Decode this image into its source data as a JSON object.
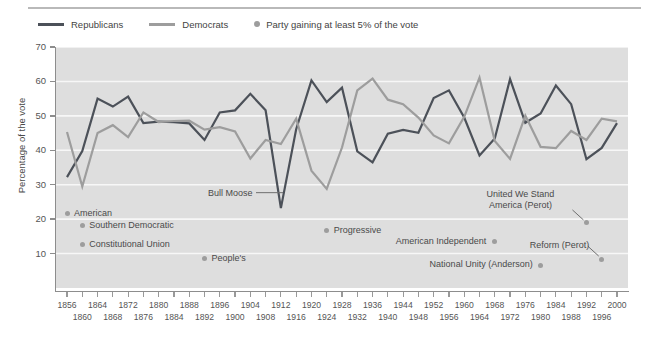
{
  "legend": {
    "items": [
      {
        "label": "Republicans",
        "kind": "line",
        "color": "#4c5159",
        "icon": "line-swatch-icon"
      },
      {
        "label": "Democrats",
        "kind": "line",
        "color": "#9d9d9d",
        "icon": "line-swatch-icon"
      },
      {
        "label": "Party gaining at least 5% of the vote",
        "kind": "dot",
        "color": "#9d9d9d",
        "icon": "dot-swatch-icon"
      }
    ]
  },
  "chart_data": {
    "type": "line",
    "title": "",
    "xlabel": "",
    "ylabel": "Percentage of the vote",
    "ylim": [
      0,
      70
    ],
    "yticks": [
      10,
      20,
      30,
      40,
      50,
      60,
      70
    ],
    "grid": true,
    "legend_position": "top-left",
    "plot_background": "#dedede",
    "x": [
      1856,
      1860,
      1864,
      1868,
      1872,
      1876,
      1880,
      1884,
      1888,
      1892,
      1896,
      1900,
      1904,
      1908,
      1912,
      1916,
      1920,
      1924,
      1928,
      1932,
      1936,
      1940,
      1944,
      1948,
      1952,
      1956,
      1960,
      1964,
      1968,
      1972,
      1976,
      1980,
      1984,
      1988,
      1992,
      1996,
      2000
    ],
    "series": [
      {
        "name": "Republicans",
        "color": "#4c5159",
        "values": [
          32.2,
          39.8,
          55.0,
          52.7,
          55.6,
          47.9,
          48.3,
          48.2,
          47.8,
          43.0,
          51.0,
          51.6,
          56.4,
          51.6,
          23.2,
          46.1,
          60.3,
          54.0,
          58.2,
          39.7,
          36.5,
          44.8,
          45.9,
          45.1,
          55.2,
          57.4,
          49.5,
          38.5,
          43.4,
          60.7,
          48.0,
          50.7,
          58.8,
          53.4,
          37.4,
          40.7,
          47.9
        ]
      },
      {
        "name": "Democrats",
        "color": "#9d9d9d",
        "values": [
          45.3,
          29.5,
          45.0,
          47.3,
          43.8,
          51.0,
          48.2,
          48.5,
          48.6,
          46.0,
          46.7,
          45.5,
          37.6,
          43.0,
          41.8,
          49.2,
          34.1,
          28.8,
          40.8,
          57.4,
          60.8,
          54.7,
          53.4,
          49.5,
          44.3,
          42.0,
          49.7,
          61.1,
          42.7,
          37.5,
          50.1,
          41.0,
          40.6,
          45.6,
          43.0,
          49.2,
          48.4
        ]
      }
    ],
    "third_party_points": [
      {
        "label": "American",
        "year": 1856,
        "value": 21.5,
        "label_position": "right",
        "leader": false
      },
      {
        "label": "Southern Democratic",
        "year": 1860,
        "value": 18.1,
        "label_position": "right",
        "leader": false
      },
      {
        "label": "Constitutional Union",
        "year": 1860,
        "value": 12.6,
        "label_position": "right",
        "leader": false
      },
      {
        "label": "People's",
        "year": 1892,
        "value": 8.5,
        "label_position": "right",
        "leader": false
      },
      {
        "label": "Bull Moose",
        "year": 1912,
        "value": 27.4,
        "label_position": "left",
        "leader": true
      },
      {
        "label": "Progressive",
        "year": 1924,
        "value": 16.6,
        "label_position": "right",
        "leader": false
      },
      {
        "label": "American Independent",
        "year": 1968,
        "value": 13.5,
        "label_position": "left",
        "leader": false
      },
      {
        "label": "National Unity (Anderson)",
        "year": 1980,
        "value": 6.6,
        "label_position": "left",
        "leader": false
      },
      {
        "label": "United We Stand America (Perot)",
        "year": 1992,
        "value": 18.9,
        "label_position": "above-left",
        "leader": true
      },
      {
        "label": "Reform (Perot)",
        "year": 1996,
        "value": 8.4,
        "label_position": "above-left",
        "leader": true
      }
    ]
  }
}
